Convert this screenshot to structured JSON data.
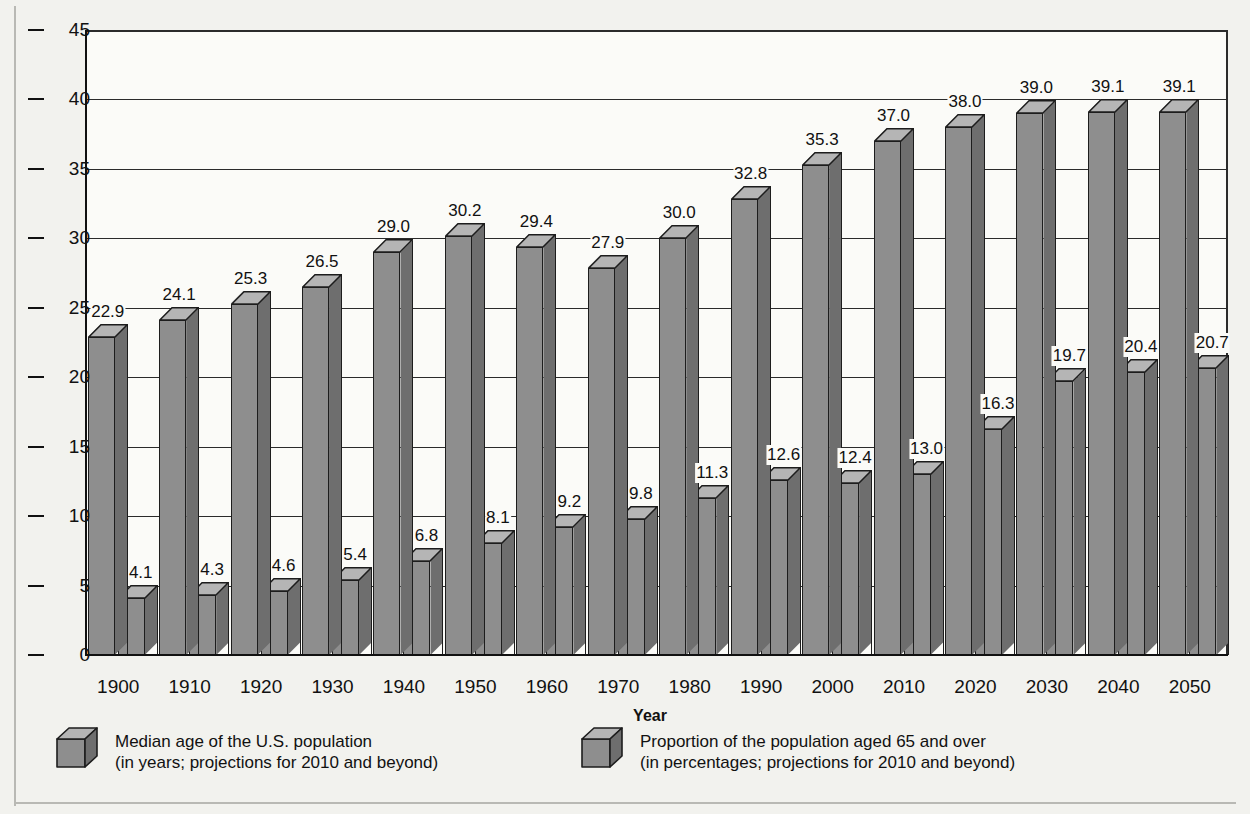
{
  "chart_data": {
    "type": "bar",
    "title": "",
    "subtitle": "",
    "xlabel": "Year",
    "ylabel": "",
    "ylim": [
      0,
      45
    ],
    "yticks": [
      0,
      5,
      10,
      15,
      20,
      25,
      30,
      35,
      40,
      45
    ],
    "grid": true,
    "legend_position": "bottom",
    "categories": [
      "1900",
      "1910",
      "1920",
      "1930",
      "1940",
      "1950",
      "1960",
      "1970",
      "1980",
      "1990",
      "2000",
      "2010",
      "2020",
      "2030",
      "2040",
      "2050"
    ],
    "series": [
      {
        "name": "Median age of the U.S. population",
        "note": "(in years; projections for 2010 and beyond)",
        "values": [
          22.9,
          24.1,
          25.3,
          26.5,
          29.0,
          30.2,
          29.4,
          27.9,
          30.0,
          32.8,
          35.3,
          37.0,
          38.0,
          39.0,
          39.1,
          39.1
        ],
        "labels": [
          "22.9",
          "24.1",
          "25.3",
          "26.5",
          "29.0",
          "30.2",
          "29.4",
          "27.9",
          "30.0",
          "32.8",
          "35.3",
          "37.0",
          "38.0",
          "39.0",
          "39.1",
          "39.1"
        ]
      },
      {
        "name": "Proportion of the population aged 65 and over",
        "note": "(in percentages; projections for 2010 and beyond)",
        "values": [
          4.1,
          4.3,
          4.6,
          5.4,
          6.8,
          8.1,
          9.2,
          9.8,
          11.3,
          12.6,
          12.4,
          13.0,
          16.3,
          19.7,
          20.4,
          20.7
        ],
        "labels": [
          "4.1",
          "4.3",
          "4.6",
          "5.4",
          "6.8",
          "8.1",
          "9.2",
          "9.8",
          "11.3",
          "12.6",
          "12.4",
          "13.0",
          "16.3",
          "19.7",
          "20.4",
          "20.7"
        ]
      }
    ],
    "colors": {
      "bar_front": "#8e8e8e",
      "bar_top": "#b5b5b5",
      "bar_side": "#6e6e6e",
      "outline": "#1d1d1d",
      "plot_background": "#fbfbf8",
      "page_background": "#f2f2ee",
      "axis": "#111111",
      "grid": "#2b2b2b"
    }
  },
  "legend": [
    {
      "label_line1": "Median age of the U.S. population",
      "label_line2": "(in years; projections for 2010 and beyond)"
    },
    {
      "label_line1": "Proportion of the population aged 65 and over",
      "label_line2": "(in percentages; projections for 2010 and beyond)"
    }
  ]
}
